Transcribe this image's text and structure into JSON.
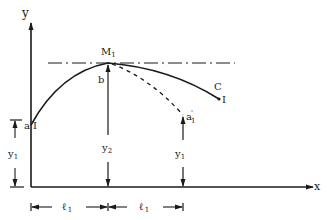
{
  "diagram": {
    "type": "trajectory sketch with dimensions",
    "axes": {
      "y_label": "y",
      "x_label": "x"
    },
    "points": {
      "start": "a",
      "start_mark": "I",
      "peak": "M",
      "peak_sub": "1",
      "peak_sub_label": "b",
      "end_curve": "C",
      "end_mark": "I",
      "alt_end": "a",
      "alt_end_prime": "'",
      "alt_end_sub": "1"
    },
    "dimensions": {
      "left_height": "y",
      "left_height_sub": "1",
      "peak_height": "y",
      "peak_height_sub": "2",
      "right_height": "y",
      "right_height_sub": "1",
      "span1": "ℓ",
      "span1_sub": "1",
      "span2": "ℓ",
      "span2_sub": "1"
    },
    "lines": {
      "reference_line": "dash-dot horizontal through M1",
      "solid_curve": "a → M1 → C",
      "dashed_curve": "M1 → a'1"
    },
    "colors": {
      "ink": "#1a1a1a",
      "background": "#ffffff"
    }
  }
}
